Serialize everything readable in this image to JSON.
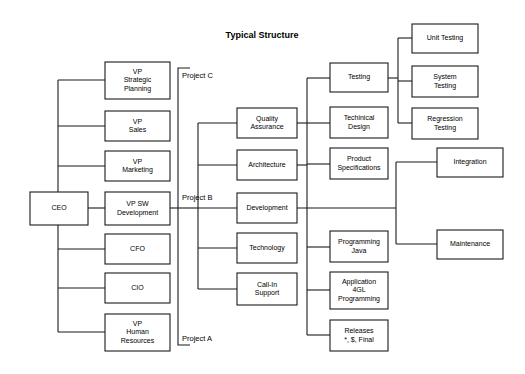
{
  "title": "Typical Structure",
  "chart_data": {
    "type": "diagram",
    "diagram_kind": "organizational-chart",
    "title": "Typical Structure",
    "background": "#ffffff",
    "line_color": "#1a1a1a",
    "box_fill": "#ffffff",
    "nodes": [
      {
        "id": "ceo",
        "label": "CEO",
        "lines": [
          "CEO"
        ],
        "x": 30,
        "y": 192,
        "w": 58,
        "h": 33,
        "column": "root"
      },
      {
        "id": "vp-strategic-planning",
        "label": "VP Strategic Planning",
        "lines": [
          "VP",
          "Strategic",
          "Planning"
        ],
        "x": 105,
        "y": 62,
        "w": 65,
        "h": 37,
        "column": "executives"
      },
      {
        "id": "vp-sales",
        "label": "VP Sales",
        "lines": [
          "VP",
          "Sales"
        ],
        "x": 105,
        "y": 111,
        "w": 65,
        "h": 30,
        "column": "executives"
      },
      {
        "id": "vp-marketing",
        "label": "VP Marketing",
        "lines": [
          "VP",
          "Marketing"
        ],
        "x": 105,
        "y": 151,
        "w": 65,
        "h": 30,
        "column": "executives"
      },
      {
        "id": "vp-sw-development",
        "label": "VP SW Development",
        "lines": [
          "VP SW",
          "Development"
        ],
        "x": 105,
        "y": 192,
        "w": 65,
        "h": 33,
        "column": "executives"
      },
      {
        "id": "cfo",
        "label": "CFO",
        "lines": [
          "CFO"
        ],
        "x": 105,
        "y": 234,
        "w": 65,
        "h": 30,
        "column": "executives"
      },
      {
        "id": "cio",
        "label": "CIO",
        "lines": [
          "CIO"
        ],
        "x": 105,
        "y": 273,
        "w": 65,
        "h": 30,
        "column": "executives"
      },
      {
        "id": "vp-human-resources",
        "label": "VP Human Resources",
        "lines": [
          "VP",
          "Human",
          "Resources"
        ],
        "x": 105,
        "y": 314,
        "w": 65,
        "h": 37,
        "column": "executives"
      },
      {
        "id": "quality-assurance",
        "label": "Quality Assurance",
        "lines": [
          "Quality",
          "Assurance"
        ],
        "x": 237,
        "y": 108,
        "w": 60,
        "h": 30,
        "column": "functions"
      },
      {
        "id": "architecture",
        "label": "Architecture",
        "lines": [
          "Architecture"
        ],
        "x": 237,
        "y": 150,
        "w": 60,
        "h": 30,
        "column": "functions"
      },
      {
        "id": "development",
        "label": "Development",
        "lines": [
          "Development"
        ],
        "x": 237,
        "y": 193,
        "w": 60,
        "h": 30,
        "column": "functions"
      },
      {
        "id": "technology",
        "label": "Technology",
        "lines": [
          "Technology"
        ],
        "x": 237,
        "y": 233,
        "w": 60,
        "h": 30,
        "column": "functions"
      },
      {
        "id": "call-in-support",
        "label": "Call-In Support",
        "lines": [
          "Call-In",
          "Support"
        ],
        "x": 237,
        "y": 273,
        "w": 60,
        "h": 32,
        "column": "functions"
      },
      {
        "id": "testing",
        "label": "Testing",
        "lines": [
          "Testing"
        ],
        "x": 330,
        "y": 63,
        "w": 58,
        "h": 29,
        "column": "activities"
      },
      {
        "id": "techinical-design",
        "label": "Techinical Design",
        "lines": [
          "Techinical",
          "Design"
        ],
        "x": 330,
        "y": 107,
        "w": 58,
        "h": 31,
        "column": "activities"
      },
      {
        "id": "product-specifications",
        "label": "Product Specifications",
        "lines": [
          "Product",
          "Specifications"
        ],
        "x": 330,
        "y": 148,
        "w": 58,
        "h": 31,
        "column": "activities"
      },
      {
        "id": "programming-java",
        "label": "Programming Java",
        "lines": [
          "Programming",
          "Java"
        ],
        "x": 330,
        "y": 231,
        "w": 58,
        "h": 31,
        "column": "activities"
      },
      {
        "id": "application-4gl-programming",
        "label": "Application 4GL Programming",
        "lines": [
          "Application",
          "4GL",
          "Programming"
        ],
        "x": 330,
        "y": 272,
        "w": 58,
        "h": 37,
        "column": "activities"
      },
      {
        "id": "releases",
        "label": "Releases *, $, Final",
        "lines": [
          "Releases",
          "*, $, Final"
        ],
        "x": 330,
        "y": 320,
        "w": 58,
        "h": 31,
        "column": "activities"
      },
      {
        "id": "unit-testing",
        "label": "Unit Testing",
        "lines": [
          "Unit Testing"
        ],
        "x": 412,
        "y": 24,
        "w": 66,
        "h": 29,
        "column": "details"
      },
      {
        "id": "system-testing",
        "label": "System Testing",
        "lines": [
          "System",
          "Testing"
        ],
        "x": 412,
        "y": 66,
        "w": 66,
        "h": 31,
        "column": "details"
      },
      {
        "id": "regression-testing",
        "label": "Regression Testing",
        "lines": [
          "Regression",
          "Testing"
        ],
        "x": 412,
        "y": 108,
        "w": 66,
        "h": 31,
        "column": "details"
      },
      {
        "id": "integration",
        "label": "Integration",
        "lines": [
          "Integration"
        ],
        "x": 437,
        "y": 148,
        "w": 66,
        "h": 29,
        "column": "details"
      },
      {
        "id": "maintenance",
        "label": "Maintenance",
        "lines": [
          "Maintenance"
        ],
        "x": 437,
        "y": 230,
        "w": 66,
        "h": 29,
        "column": "details"
      }
    ],
    "project_brackets": [
      {
        "id": "project-outer",
        "x": 178,
        "top": 68,
        "bottom": 345,
        "tick": 12,
        "labels": [
          {
            "id": "project-c",
            "text": "Project C",
            "x": 182,
            "y": 76
          },
          {
            "id": "project-b",
            "text": "Project B",
            "x": 182,
            "y": 198
          },
          {
            "id": "project-a",
            "text": "Project A",
            "x": 182,
            "y": 339
          }
        ]
      }
    ],
    "connector_buses": [
      {
        "id": "ceo-executives-bus",
        "x": 58,
        "top": 80,
        "bottom": 332
      },
      {
        "id": "functions-bus",
        "x": 198,
        "top": 123,
        "bottom": 289
      },
      {
        "id": "activities-bus",
        "x": 307,
        "top": 78,
        "bottom": 335
      },
      {
        "id": "testing-children-bus",
        "x": 398,
        "top": 38,
        "bottom": 123
      },
      {
        "id": "development-children-bus",
        "x": 396,
        "top": 162,
        "bottom": 244
      }
    ],
    "edges": [
      {
        "from": "ceo",
        "to": "vp-strategic-planning",
        "via": "ceo-executives-bus"
      },
      {
        "from": "ceo",
        "to": "vp-sales",
        "via": "ceo-executives-bus"
      },
      {
        "from": "ceo",
        "to": "vp-marketing",
        "via": "ceo-executives-bus"
      },
      {
        "from": "ceo",
        "to": "vp-sw-development",
        "via": "direct"
      },
      {
        "from": "ceo",
        "to": "cfo",
        "via": "ceo-executives-bus"
      },
      {
        "from": "ceo",
        "to": "cio",
        "via": "ceo-executives-bus"
      },
      {
        "from": "ceo",
        "to": "vp-human-resources",
        "via": "ceo-executives-bus"
      },
      {
        "from": "vp-sw-development",
        "to": "quality-assurance",
        "via": "functions-bus"
      },
      {
        "from": "vp-sw-development",
        "to": "architecture",
        "via": "functions-bus"
      },
      {
        "from": "vp-sw-development",
        "to": "development",
        "via": "direct"
      },
      {
        "from": "vp-sw-development",
        "to": "technology",
        "via": "functions-bus"
      },
      {
        "from": "vp-sw-development",
        "to": "call-in-support",
        "via": "functions-bus"
      },
      {
        "from": "quality-assurance",
        "to": "testing",
        "via": "activities-bus"
      },
      {
        "from": "architecture",
        "to": "techinical-design",
        "via": "activities-bus"
      },
      {
        "from": "development",
        "to": "product-specifications",
        "via": "activities-bus"
      },
      {
        "from": "development",
        "to": "programming-java",
        "via": "activities-bus"
      },
      {
        "from": "development",
        "to": "application-4gl-programming",
        "via": "activities-bus"
      },
      {
        "from": "development",
        "to": "releases",
        "via": "activities-bus"
      },
      {
        "from": "testing",
        "to": "unit-testing",
        "via": "testing-children-bus"
      },
      {
        "from": "testing",
        "to": "system-testing",
        "via": "testing-children-bus"
      },
      {
        "from": "testing",
        "to": "regression-testing",
        "via": "testing-children-bus"
      },
      {
        "from": "development",
        "to": "integration",
        "via": "development-children-bus"
      },
      {
        "from": "development",
        "to": "maintenance",
        "via": "development-children-bus"
      }
    ],
    "connector_segments": [
      {
        "id": "ceo-bus-vertical",
        "x1": 58,
        "y1": 80,
        "x2": 58,
        "y2": 332
      },
      {
        "id": "ceo-to-bus",
        "x1": 30,
        "y1": 208,
        "x2": 58,
        "y2": 208
      },
      {
        "id": "bus-to-vp-strategic",
        "x1": 58,
        "y1": 80,
        "x2": 105,
        "y2": 80
      },
      {
        "id": "bus-to-vp-sales",
        "x1": 58,
        "y1": 126,
        "x2": 105,
        "y2": 126
      },
      {
        "id": "bus-to-vp-marketing",
        "x1": 58,
        "y1": 166,
        "x2": 105,
        "y2": 166
      },
      {
        "id": "ceo-to-vp-sw",
        "x1": 88,
        "y1": 208,
        "x2": 105,
        "y2": 208
      },
      {
        "id": "bus-to-cfo",
        "x1": 58,
        "y1": 249,
        "x2": 105,
        "y2": 249
      },
      {
        "id": "bus-to-cio",
        "x1": 58,
        "y1": 288,
        "x2": 105,
        "y2": 288
      },
      {
        "id": "bus-to-vp-hr",
        "x1": 58,
        "y1": 332,
        "x2": 105,
        "y2": 332
      },
      {
        "id": "functions-bus-vertical",
        "x1": 198,
        "y1": 123,
        "x2": 198,
        "y2": 289
      },
      {
        "id": "vp-sw-to-functions-bus",
        "x1": 170,
        "y1": 208,
        "x2": 198,
        "y2": 208
      },
      {
        "id": "functions-bus-to-qa",
        "x1": 198,
        "y1": 123,
        "x2": 237,
        "y2": 123
      },
      {
        "id": "functions-bus-to-architecture",
        "x1": 198,
        "y1": 165,
        "x2": 237,
        "y2": 165
      },
      {
        "id": "functions-bus-to-development",
        "x1": 198,
        "y1": 208,
        "x2": 237,
        "y2": 208
      },
      {
        "id": "functions-bus-to-technology",
        "x1": 198,
        "y1": 248,
        "x2": 237,
        "y2": 248
      },
      {
        "id": "functions-bus-to-callin",
        "x1": 198,
        "y1": 289,
        "x2": 237,
        "y2": 289
      },
      {
        "id": "activities-bus-vertical",
        "x1": 307,
        "y1": 78,
        "x2": 307,
        "y2": 335
      },
      {
        "id": "qa-to-activities-bus",
        "x1": 297,
        "y1": 123,
        "x2": 307,
        "y2": 123
      },
      {
        "id": "architecture-to-activities-bus",
        "x1": 297,
        "y1": 165,
        "x2": 307,
        "y2": 165
      },
      {
        "id": "activities-bus-to-testing",
        "x1": 307,
        "y1": 78,
        "x2": 330,
        "y2": 78
      },
      {
        "id": "activities-bus-to-techdesign",
        "x1": 307,
        "y1": 123,
        "x2": 330,
        "y2": 123
      },
      {
        "id": "activities-bus-to-prodspec",
        "x1": 307,
        "y1": 164,
        "x2": 330,
        "y2": 164
      },
      {
        "id": "activities-bus-to-progjava",
        "x1": 307,
        "y1": 247,
        "x2": 330,
        "y2": 247
      },
      {
        "id": "activities-bus-to-app4gl",
        "x1": 307,
        "y1": 290,
        "x2": 330,
        "y2": 290
      },
      {
        "id": "activities-bus-to-releases",
        "x1": 307,
        "y1": 335,
        "x2": 330,
        "y2": 335
      },
      {
        "id": "development-long-right",
        "x1": 297,
        "y1": 208,
        "x2": 396,
        "y2": 208
      },
      {
        "id": "testing-bus-vertical",
        "x1": 398,
        "y1": 38,
        "x2": 398,
        "y2": 123
      },
      {
        "id": "testing-to-bus",
        "x1": 388,
        "y1": 78,
        "x2": 398,
        "y2": 78
      },
      {
        "id": "testing-bus-to-unit",
        "x1": 398,
        "y1": 38,
        "x2": 412,
        "y2": 38
      },
      {
        "id": "testing-bus-to-system",
        "x1": 398,
        "y1": 81,
        "x2": 412,
        "y2": 81
      },
      {
        "id": "testing-bus-to-regression",
        "x1": 398,
        "y1": 123,
        "x2": 412,
        "y2": 123
      },
      {
        "id": "dev-children-bus-vertical",
        "x1": 396,
        "y1": 162,
        "x2": 396,
        "y2": 244
      },
      {
        "id": "dev-bus-to-integration",
        "x1": 396,
        "y1": 162,
        "x2": 437,
        "y2": 162
      },
      {
        "id": "dev-bus-to-maintenance",
        "x1": 396,
        "y1": 244,
        "x2": 437,
        "y2": 244
      }
    ]
  }
}
